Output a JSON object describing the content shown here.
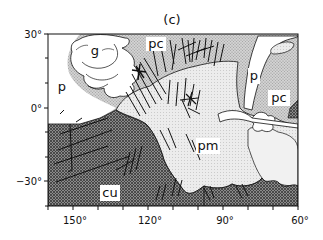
{
  "figure": {
    "title": "(c)",
    "map_type": "geologic / tectonic region map",
    "x_axis": {
      "tick_labels": [
        "150°",
        "120°",
        "90°",
        "60°"
      ],
      "range_deg": [
        160,
        60
      ],
      "minor_tick_step_deg": 10
    },
    "y_axis": {
      "tick_labels": [
        "30°",
        "0°",
        "−30°"
      ],
      "range_deg": [
        30,
        -40
      ],
      "minor_tick_step_deg": 10
    },
    "regions": [
      {
        "id": "g",
        "label": "g",
        "fill": "white-outlined plain"
      },
      {
        "id": "pc-north",
        "label": "pc",
        "fill": "light stipple"
      },
      {
        "id": "p-west",
        "label": "p",
        "fill": "white plain"
      },
      {
        "id": "p-east",
        "label": "p",
        "fill": "white plain"
      },
      {
        "id": "pc-east",
        "label": "pc",
        "fill": "light stipple"
      },
      {
        "id": "pm",
        "label": "pm",
        "fill": "very light stipple"
      },
      {
        "id": "cu",
        "label": "cu",
        "fill": "dark crosshatch"
      }
    ],
    "colors": {
      "background": "#ffffff",
      "ink": "#111111",
      "dark_unit": "#6e6e6e",
      "medium_unit": "#c9c9c9",
      "light_unit": "#e4e4e4",
      "white_unit": "#ffffff"
    }
  }
}
